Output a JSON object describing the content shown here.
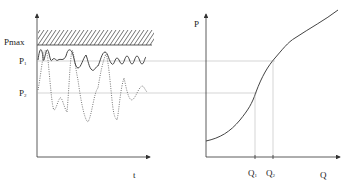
{
  "left_plot": {
    "y_labels": {
      "pmax": "Pmax",
      "p1": "P",
      "p1_sub": "1",
      "p2": "P",
      "p2_sub": "2"
    },
    "x_label": "t",
    "series": [
      {
        "name": "solid-power-curve",
        "style": "solid"
      },
      {
        "name": "dotted-power-curve",
        "style": "dotted"
      }
    ],
    "hatched_region": "above Pmax"
  },
  "right_plot": {
    "y_label": "P",
    "x_label": "Q",
    "q1": "Q",
    "q1_sub": "1",
    "q2": "Q",
    "q2_sub": "2",
    "curve": "S-shaped P vs Q"
  },
  "colors": {
    "axis": "#333333",
    "curve": "#444444",
    "guide": "#aaaaaa"
  }
}
